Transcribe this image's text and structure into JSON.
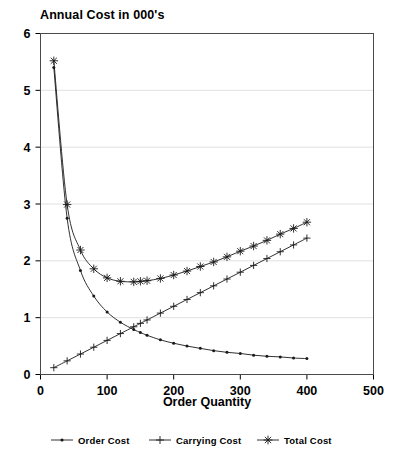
{
  "chart_data": {
    "type": "line",
    "title": "Annual Cost in 000's",
    "xlabel": "Order Quantity",
    "ylabel": "",
    "xlim": [
      0,
      500
    ],
    "ylim": [
      0,
      6
    ],
    "xticks": [
      "0",
      "100",
      "200",
      "300",
      "400",
      "500"
    ],
    "yticks": [
      "0",
      "1",
      "2",
      "3",
      "4",
      "5",
      "6"
    ],
    "grid": "horizontal-only",
    "legend_position": "below-plot",
    "x": [
      20,
      40,
      60,
      80,
      100,
      120,
      140,
      150,
      160,
      180,
      200,
      220,
      240,
      260,
      280,
      300,
      320,
      340,
      360,
      380,
      400
    ],
    "series": [
      {
        "name": "Order Cost",
        "marker": "dot",
        "values": [
          5.4,
          2.75,
          1.83,
          1.38,
          1.1,
          0.92,
          0.79,
          0.74,
          0.69,
          0.61,
          0.55,
          0.5,
          0.46,
          0.42,
          0.39,
          0.37,
          0.34,
          0.32,
          0.31,
          0.29,
          0.28
        ]
      },
      {
        "name": "Carrying Cost",
        "marker": "plus",
        "values": [
          0.12,
          0.24,
          0.36,
          0.48,
          0.6,
          0.72,
          0.84,
          0.9,
          0.96,
          1.08,
          1.2,
          1.32,
          1.44,
          1.56,
          1.68,
          1.8,
          1.92,
          2.04,
          2.16,
          2.28,
          2.4
        ]
      },
      {
        "name": "Total Cost",
        "marker": "asterisk",
        "values": [
          5.52,
          2.99,
          2.19,
          1.86,
          1.7,
          1.64,
          1.63,
          1.64,
          1.65,
          1.69,
          1.75,
          1.82,
          1.9,
          1.98,
          2.07,
          2.17,
          2.26,
          2.36,
          2.47,
          2.57,
          2.68
        ]
      }
    ],
    "legend": [
      {
        "label": "Order Cost",
        "marker": "dot"
      },
      {
        "label": "Carrying Cost",
        "marker": "plus"
      },
      {
        "label": "Total Cost",
        "marker": "asterisk"
      }
    ],
    "colors": {
      "line": "#1a1a1a",
      "frame": "#4a4a4a",
      "grid": "#d8d8d8",
      "background": "#ffffff"
    }
  }
}
